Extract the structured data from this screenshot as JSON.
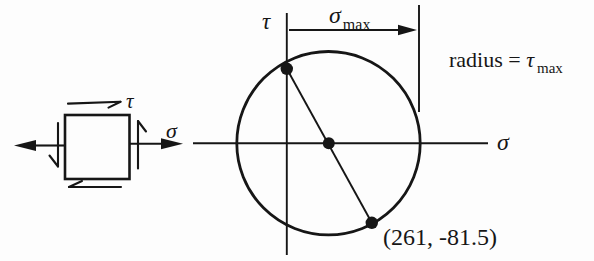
{
  "colors": {
    "ink": "#161616",
    "bg": "#fdfdfd"
  },
  "stress_element": {
    "tau_label": "τ",
    "sigma_label": "σ"
  },
  "mohr_diagram": {
    "tau_axis_label": "τ",
    "sigma_axis_label": "σ",
    "sigma_max_symbol": "σ",
    "sigma_max_subscript": "max",
    "radius_prefix": "radius = ",
    "radius_symbol": "τ",
    "radius_subscript": "max",
    "point_label": "(261, -81.5)"
  }
}
